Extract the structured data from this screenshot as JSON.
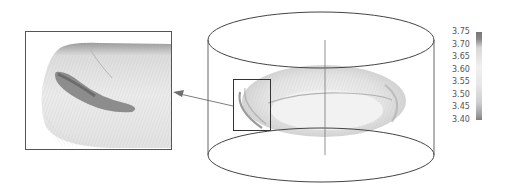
{
  "figure": {
    "colorbar": {
      "ticks": [
        "3.75",
        "3.70",
        "3.65",
        "3.60",
        "3.55",
        "3.50",
        "3.45",
        "3.40"
      ],
      "min": 3.4,
      "max": 3.75,
      "colors": {
        "high": "#777777",
        "mid": "#f0f0f0",
        "low": "#808080"
      }
    },
    "inset": {
      "label": "zoomed-region"
    },
    "colors": {
      "outline": "#444444",
      "surface_light": "#e8e8e8",
      "surface_dark": "#8a8a8a"
    }
  }
}
